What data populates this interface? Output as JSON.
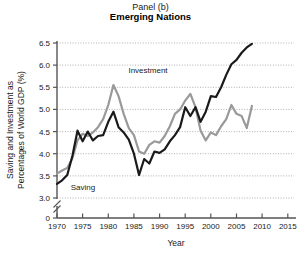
{
  "title": {
    "panel": "Panel (b)",
    "subtitle": "Emerging Nations"
  },
  "axes": {
    "xlabel": "Year",
    "ylabel_line1": "Saving and Investment as",
    "ylabel_line2": "Percentages of World GDP (%)",
    "xticks": [
      "1970",
      "1975",
      "1980",
      "1985",
      "1990",
      "1995",
      "2000",
      "2005",
      "2010",
      "2015"
    ],
    "yticks": [
      "0",
      "3.0",
      "3.5",
      "4.0",
      "4.5",
      "5.0",
      "5.5",
      "6.0",
      "6.5"
    ],
    "axis_break_symbol": "//"
  },
  "annotations": {
    "investment_label": "Investment",
    "saving_label": "Saving"
  },
  "colors": {
    "investment_line": "#999999",
    "saving_line": "#1a1a1a",
    "gridline": "#b0b0b0",
    "axis": "#555555",
    "background": "#ffffff"
  },
  "chart_data": {
    "type": "line",
    "title": "Panel (b) Emerging Nations",
    "subtitle": "Emerging Nations",
    "xlabel": "Year",
    "ylabel": "Saving and Investment as Percentages of World GDP (%)",
    "xlim": [
      1970,
      2015
    ],
    "ylim": [
      3.0,
      6.5
    ],
    "y_axis_break": "axis broken between 0 and 3.0",
    "xticks": [
      1970,
      1975,
      1980,
      1985,
      1990,
      1995,
      2000,
      2005,
      2010,
      2015
    ],
    "yticks": [
      3.0,
      3.5,
      4.0,
      4.5,
      5.0,
      5.5,
      6.0,
      6.5
    ],
    "grid": "horizontal dotted gridlines",
    "legend": "inline labels on curves",
    "x": [
      1970,
      1971,
      1972,
      1973,
      1974,
      1975,
      1976,
      1977,
      1978,
      1979,
      1980,
      1981,
      1982,
      1983,
      1984,
      1985,
      1986,
      1987,
      1988,
      1989,
      1990,
      1991,
      1992,
      1993,
      1994,
      1995,
      1996,
      1997,
      1998,
      1999,
      2000,
      2001,
      2002,
      2003,
      2004,
      2005,
      2006,
      2007,
      2008
    ],
    "series": [
      {
        "name": "Investment",
        "color": "#999999",
        "values": [
          3.55,
          3.62,
          3.68,
          3.9,
          4.3,
          4.45,
          4.4,
          4.48,
          4.6,
          4.78,
          5.1,
          5.55,
          5.3,
          4.9,
          4.58,
          4.42,
          4.05,
          4.0,
          4.2,
          4.28,
          4.25,
          4.4,
          4.62,
          4.9,
          5.0,
          5.2,
          5.35,
          5.05,
          4.52,
          4.3,
          4.48,
          4.42,
          4.62,
          4.78,
          5.1,
          4.9,
          4.85,
          4.58,
          5.08
        ]
      },
      {
        "name": "Saving",
        "color": "#1a1a1a",
        "values": [
          3.32,
          3.4,
          3.52,
          3.95,
          4.52,
          4.28,
          4.5,
          4.3,
          4.4,
          4.42,
          4.72,
          4.95,
          4.6,
          4.48,
          4.32,
          4.0,
          3.52,
          3.88,
          3.78,
          4.05,
          4.02,
          4.1,
          4.28,
          4.42,
          4.6,
          5.05,
          4.85,
          5.05,
          4.72,
          4.95,
          5.3,
          5.28,
          5.5,
          5.78,
          6.02,
          6.12,
          6.28,
          6.4,
          6.48
        ]
      }
    ]
  }
}
